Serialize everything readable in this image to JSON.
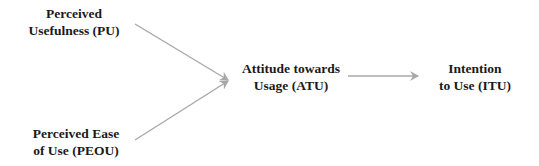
{
  "diagram": {
    "type": "flow",
    "nodes": [
      {
        "id": "PU",
        "lines": [
          "Perceived",
          "Usefulness (PU)"
        ]
      },
      {
        "id": "PEOU",
        "lines": [
          "Perceived Ease",
          "of Use (PEOU)"
        ]
      },
      {
        "id": "ATU",
        "lines": [
          "Attitude towards",
          "Usage (ATU)"
        ]
      },
      {
        "id": "ITU",
        "lines": [
          "Intention",
          "to Use (ITU)"
        ]
      }
    ],
    "edges": [
      {
        "from": "PU",
        "to": "ATU"
      },
      {
        "from": "PEOU",
        "to": "ATU"
      },
      {
        "from": "ATU",
        "to": "ITU"
      }
    ],
    "colors": {
      "text": "#1a1a1a",
      "arrow": "#a8a8a8"
    }
  }
}
